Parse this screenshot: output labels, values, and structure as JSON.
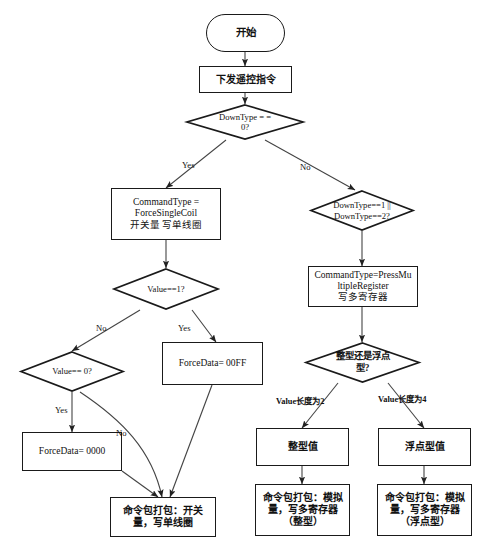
{
  "diagram": {
    "background_color": "#ffffff",
    "line_color": "#333333",
    "text_color": "#111111"
  },
  "nodes": {
    "start": {
      "label": "开始",
      "shape": "terminal"
    },
    "send_cmd": {
      "label": "下发遥控指令",
      "shape": "process"
    },
    "downtype_zero": {
      "label": "DownType = =\n0?",
      "shape": "decision"
    },
    "force_single_coil": {
      "label": "CommandType =\nForceSingleCoil\n开关量 写单线圈",
      "shape": "process"
    },
    "downtype_one_two": {
      "label": "DownType==1 ||\nDownType==2?",
      "shape": "decision"
    },
    "press_multiple_register": {
      "label": "CommandType=PressMu\nltipleRegister\n写多寄存器",
      "shape": "process"
    },
    "value_eq_one": {
      "label": "Value==1?",
      "shape": "decision"
    },
    "value_eq_zero": {
      "label": "Value== 0?",
      "shape": "decision"
    },
    "force_data_00ff": {
      "label": "ForceData= 00FF",
      "shape": "process"
    },
    "force_data_0000": {
      "label": "ForceData= 0000",
      "shape": "process"
    },
    "int_or_float": {
      "label": "整型还是浮点\n型?",
      "shape": "decision"
    },
    "int_value": {
      "label": "整型值",
      "shape": "process"
    },
    "float_value": {
      "label": "浮点型值",
      "shape": "process"
    },
    "pack_coil": {
      "label": "命令包打包：开关\n量，写单线圈",
      "shape": "process"
    },
    "pack_register_int": {
      "label": "命令包打包：模拟\n量，写多寄存器\n（整型）",
      "shape": "process"
    },
    "pack_register_float": {
      "label": "命令包打包：模拟\n量，写多寄存器\n（浮点型）",
      "shape": "process"
    }
  },
  "edge_labels": {
    "yes_downtype": "Yes",
    "no_downtype": "No",
    "no_value_one": "No",
    "yes_value_one": "Yes",
    "yes_value_zero": "Yes",
    "no_value_zero": "No",
    "value_len_two": "Value长度为2",
    "value_len_four": "Value长度为4"
  }
}
